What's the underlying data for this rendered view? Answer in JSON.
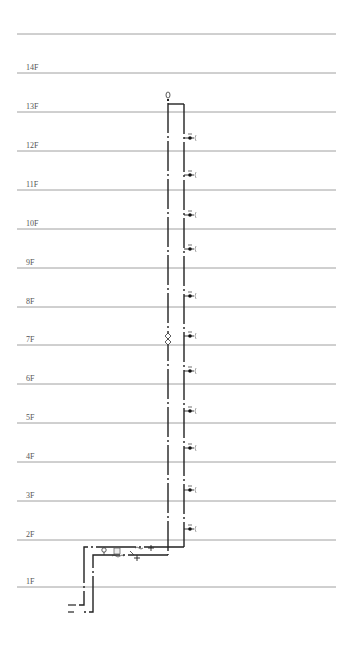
{
  "diagram": {
    "type": "water supply riser system diagram",
    "floors": [
      {
        "label": "14F",
        "y": 73
      },
      {
        "label": "13F",
        "y": 112
      },
      {
        "label": "12F",
        "y": 151
      },
      {
        "label": "11F",
        "y": 190
      },
      {
        "label": "10F",
        "y": 229
      },
      {
        "label": "9F",
        "y": 268
      },
      {
        "label": "8F",
        "y": 307
      },
      {
        "label": "7F",
        "y": 345
      },
      {
        "label": "6F",
        "y": 384
      },
      {
        "label": "5F",
        "y": 423
      },
      {
        "label": "4F",
        "y": 462
      },
      {
        "label": "3F",
        "y": 501
      },
      {
        "label": "2F",
        "y": 540
      },
      {
        "label": "1F",
        "y": 587
      }
    ],
    "roof_line_y": 34,
    "fixtures_y": [
      138,
      175,
      215,
      249,
      296,
      336,
      371,
      411,
      448,
      490,
      529
    ],
    "colors": {
      "floor_line": "#888888",
      "pipe": "#222222",
      "label": "#555555"
    }
  }
}
